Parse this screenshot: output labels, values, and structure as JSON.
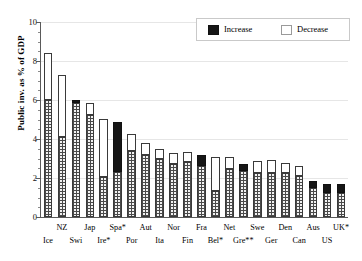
{
  "chart_data": {
    "type": "bar",
    "title": "",
    "xlabel": "",
    "ylabel": "Public inv. as % of GDP",
    "ylim": [
      0,
      10
    ],
    "ytick_labels": [
      "0",
      "2",
      "4",
      "6",
      "8",
      "10"
    ],
    "ytick_values": [
      0,
      2,
      4,
      6,
      8,
      10
    ],
    "yminor_step": 0.5,
    "grid": true,
    "legend_position": "top-right",
    "legend": [
      {
        "label": "Increase",
        "color": "#161616",
        "key": "increase"
      },
      {
        "label": "Decrease",
        "color": "#ffffff",
        "key": "decrease"
      }
    ],
    "categories": [
      "Ice",
      "NZ",
      "Swi",
      "Jap",
      "Ire*",
      "Spa*",
      "Por",
      "Aut",
      "Ita",
      "Nor",
      "Fin",
      "Fra",
      "Bel*",
      "Net",
      "Gre**",
      "Swe",
      "Ger",
      "Den",
      "Can",
      "Aus",
      "US",
      "UK*"
    ],
    "series": [
      {
        "name": "Base (hatched)",
        "values": [
          6.0,
          4.1,
          5.85,
          5.25,
          2.05,
          2.3,
          3.4,
          3.2,
          2.95,
          2.7,
          2.8,
          2.6,
          1.35,
          2.45,
          2.35,
          2.25,
          2.25,
          2.25,
          2.1,
          1.5,
          1.25,
          0.0
        ]
      },
      {
        "name": "Change segment",
        "values": [
          2.4,
          3.2,
          0.15,
          0.6,
          3.0,
          2.55,
          0.85,
          0.6,
          0.55,
          0.6,
          0.55,
          0.6,
          1.75,
          0.65,
          0.35,
          0.6,
          0.65,
          0.5,
          0.5,
          0.35,
          0.45,
          0.0
        ]
      }
    ],
    "bars": [
      {
        "label": "Ice",
        "row": 1,
        "base": 6.0,
        "top": 8.4,
        "direction": "decrease"
      },
      {
        "label": "NZ",
        "row": 0,
        "base": 4.1,
        "top": 7.3,
        "direction": "decrease"
      },
      {
        "label": "Swi",
        "row": 1,
        "base": 5.85,
        "top": 6.0,
        "direction": "increase"
      },
      {
        "label": "Jap",
        "row": 0,
        "base": 5.25,
        "top": 5.85,
        "direction": "decrease"
      },
      {
        "label": "Ire*",
        "row": 1,
        "base": 2.05,
        "top": 5.05,
        "direction": "decrease"
      },
      {
        "label": "Spa*",
        "row": 0,
        "base": 2.3,
        "top": 4.85,
        "direction": "increase"
      },
      {
        "label": "Por",
        "row": 1,
        "base": 3.4,
        "top": 4.25,
        "direction": "decrease"
      },
      {
        "label": "Aut",
        "row": 0,
        "base": 3.2,
        "top": 3.8,
        "direction": "decrease"
      },
      {
        "label": "Ita",
        "row": 1,
        "base": 2.95,
        "top": 3.5,
        "direction": "decrease"
      },
      {
        "label": "Nor",
        "row": 0,
        "base": 2.7,
        "top": 3.3,
        "direction": "decrease"
      },
      {
        "label": "Fin",
        "row": 1,
        "base": 2.8,
        "top": 3.35,
        "direction": "decrease"
      },
      {
        "label": "Fra",
        "row": 0,
        "base": 2.6,
        "top": 3.2,
        "direction": "increase"
      },
      {
        "label": "Bel*",
        "row": 1,
        "base": 1.35,
        "top": 3.1,
        "direction": "decrease"
      },
      {
        "label": "Net",
        "row": 0,
        "base": 2.45,
        "top": 3.1,
        "direction": "decrease"
      },
      {
        "label": "Gre**",
        "row": 1,
        "base": 2.35,
        "top": 2.7,
        "direction": "increase"
      },
      {
        "label": "Swe",
        "row": 0,
        "base": 2.25,
        "top": 2.85,
        "direction": "decrease"
      },
      {
        "label": "Ger",
        "row": 1,
        "base": 2.25,
        "top": 2.9,
        "direction": "decrease"
      },
      {
        "label": "Den",
        "row": 0,
        "base": 2.25,
        "top": 2.75,
        "direction": "decrease"
      },
      {
        "label": "Can",
        "row": 1,
        "base": 2.1,
        "top": 2.6,
        "direction": "decrease"
      },
      {
        "label": "Aus",
        "row": 0,
        "base": 1.5,
        "top": 1.85,
        "direction": "increase"
      },
      {
        "label": "US",
        "row": 1,
        "base": 1.25,
        "top": 1.7,
        "direction": "increase"
      },
      {
        "label": "UK*",
        "row": 0,
        "base": 1.25,
        "top": 1.7,
        "direction": "increase"
      }
    ]
  },
  "axis": {
    "y_title": "Public inv. as % of GDP",
    "y_zero_label": "0"
  },
  "legend": {
    "increase_label": "Increase",
    "decrease_label": "Decrease"
  }
}
